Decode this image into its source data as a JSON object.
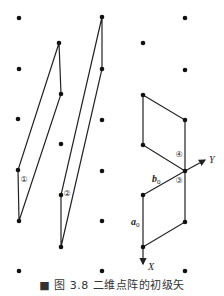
{
  "figure": {
    "caption": "■ 图 3.8  二维点阵的初级矢",
    "lattice_points": [
      [
        19,
        18
      ],
      [
        102,
        17
      ],
      [
        185,
        18
      ],
      [
        59,
        43
      ],
      [
        143,
        43
      ],
      [
        19,
        69
      ],
      [
        102,
        69
      ],
      [
        185,
        70
      ],
      [
        61,
        94
      ],
      [
        143,
        95
      ],
      [
        18,
        119
      ],
      [
        102,
        120
      ],
      [
        185,
        120
      ],
      [
        61,
        144
      ],
      [
        143,
        145
      ],
      [
        18,
        170
      ],
      [
        102,
        171
      ],
      [
        185,
        171
      ],
      [
        61,
        195
      ],
      [
        143,
        195
      ],
      [
        19,
        221
      ],
      [
        102,
        221
      ],
      [
        185,
        222
      ],
      [
        61,
        247
      ],
      [
        143,
        247
      ],
      [
        19,
        271
      ],
      [
        102,
        271
      ],
      [
        185,
        271
      ]
    ],
    "cells": [
      {
        "label": "①",
        "points": [
          [
            59,
            43
          ],
          [
            61,
            94
          ],
          [
            19,
            221
          ],
          [
            18,
            170
          ]
        ],
        "label_pos": [
          24,
          182
        ]
      },
      {
        "label": "②",
        "points": [
          [
            102,
            17
          ],
          [
            102,
            69
          ],
          [
            61,
            247
          ],
          [
            61,
            195
          ]
        ],
        "label_pos": [
          67,
          196
        ]
      },
      {
        "label": "④",
        "points": [
          [
            143,
            95
          ],
          [
            185,
            120
          ],
          [
            185,
            171
          ],
          [
            143,
            145
          ]
        ],
        "label_pos": [
          179,
          157
        ]
      },
      {
        "label": "③",
        "points": [
          [
            143,
            195
          ],
          [
            185,
            171
          ],
          [
            185,
            222
          ],
          [
            143,
            247
          ]
        ],
        "label_pos": [
          179,
          183
        ]
      }
    ],
    "vectors": {
      "a0": {
        "label": "a",
        "sub": "0",
        "label_pos": [
          132,
          225
        ]
      },
      "b0": {
        "label": "b",
        "sub": "0",
        "label_pos": [
          152,
          182
        ]
      }
    },
    "axes": {
      "x_label": "X",
      "y_label": "Y"
    }
  }
}
